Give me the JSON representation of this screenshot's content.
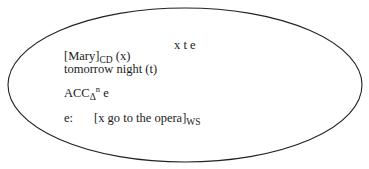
{
  "drs": {
    "universe": "x t e",
    "conditions": [
      {
        "main": "[Mary]",
        "sub": "CD",
        "tail": " (x)"
      },
      {
        "main": "tomorrow night (t)"
      },
      {
        "main": "ACC",
        "sub": "Δ",
        "sup": "n",
        "tail": " e"
      },
      {
        "label": "e:",
        "main": "[x go to the opera]",
        "sub": "WS"
      }
    ]
  }
}
